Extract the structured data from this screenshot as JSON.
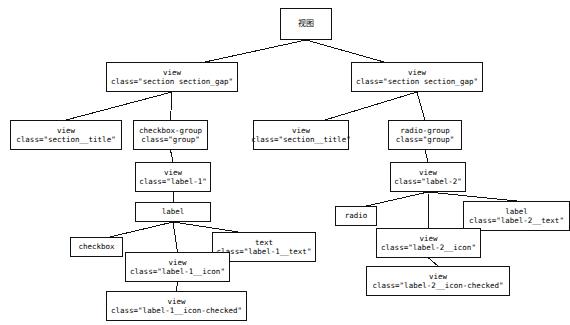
{
  "diagram": {
    "title": "视图",
    "type": "component-tree",
    "nodes": [
      {
        "id": "root",
        "tag": "视图",
        "cls": "",
        "x": 280,
        "y": 8,
        "w": 52,
        "h": 32,
        "cjk": true
      },
      {
        "id": "sec-left",
        "tag": "view",
        "cls": "class=\"section section_gap\"",
        "x": 106,
        "y": 62,
        "w": 132,
        "h": 30,
        "cjk": false
      },
      {
        "id": "sec-right",
        "tag": "view",
        "cls": "class=\"section section_gap\"",
        "x": 351,
        "y": 62,
        "w": 132,
        "h": 30,
        "cjk": false
      },
      {
        "id": "title-left",
        "tag": "view",
        "cls": "class=\"section__title\"",
        "x": 10,
        "y": 120,
        "w": 112,
        "h": 30,
        "cjk": false
      },
      {
        "id": "checkbox-group",
        "tag": "checkbox-group",
        "cls": "class=\"group\"",
        "x": 133,
        "y": 120,
        "w": 75,
        "h": 30,
        "cjk": false
      },
      {
        "id": "title-right",
        "tag": "view",
        "cls": "class=\"section__title\"",
        "x": 253,
        "y": 120,
        "w": 96,
        "h": 30,
        "cjk": false
      },
      {
        "id": "radio-group",
        "tag": "radio-group",
        "cls": "class=\"group\"",
        "x": 388,
        "y": 120,
        "w": 74,
        "h": 30,
        "cjk": false
      },
      {
        "id": "label-1",
        "tag": "view",
        "cls": "class=\"label-1\"",
        "x": 135,
        "y": 162,
        "w": 76,
        "h": 30,
        "cjk": false
      },
      {
        "id": "label-2",
        "tag": "view",
        "cls": "class=\"label-2\"",
        "x": 390,
        "y": 162,
        "w": 76,
        "h": 30,
        "cjk": false
      },
      {
        "id": "label",
        "tag": "label",
        "cls": "",
        "x": 135,
        "y": 202,
        "w": 76,
        "h": 20,
        "cjk": false
      },
      {
        "id": "checkbox",
        "tag": "checkbox",
        "cls": "",
        "x": 70,
        "y": 237,
        "w": 53,
        "h": 20,
        "cjk": false
      },
      {
        "id": "text-1",
        "tag": "text",
        "cls": "class=\"label-1__text\"",
        "x": 212,
        "y": 232,
        "w": 104,
        "h": 30,
        "cjk": false
      },
      {
        "id": "icon-1",
        "tag": "view",
        "cls": "class=\"label-1__icon\"",
        "x": 125,
        "y": 252,
        "w": 105,
        "h": 30,
        "cjk": false
      },
      {
        "id": "icon-1-checked",
        "tag": "view",
        "cls": "class=\"label-1__icon-checked\"",
        "x": 106,
        "y": 291,
        "w": 141,
        "h": 30,
        "cjk": false
      },
      {
        "id": "radio",
        "tag": "radio",
        "cls": "",
        "x": 335,
        "y": 206,
        "w": 42,
        "h": 20,
        "cjk": false
      },
      {
        "id": "text-2",
        "tag": "label",
        "cls": "class=\"label-2__text\"",
        "x": 463,
        "y": 201,
        "w": 107,
        "h": 30,
        "cjk": false
      },
      {
        "id": "icon-2",
        "tag": "view",
        "cls": "class=\"label-2__icon\"",
        "x": 376,
        "y": 228,
        "w": 105,
        "h": 30,
        "cjk": false
      },
      {
        "id": "icon-2-checked",
        "tag": "view",
        "cls": "class=\"label-2__icon-checked\"",
        "x": 366,
        "y": 266,
        "w": 144,
        "h": 30,
        "cjk": false
      }
    ],
    "edges": [
      {
        "from": "root",
        "to": "sec-left"
      },
      {
        "from": "root",
        "to": "sec-right"
      },
      {
        "from": "sec-left",
        "to": "title-left"
      },
      {
        "from": "sec-left",
        "to": "checkbox-group"
      },
      {
        "from": "sec-right",
        "to": "title-right"
      },
      {
        "from": "sec-right",
        "to": "radio-group"
      },
      {
        "from": "checkbox-group",
        "to": "label-1"
      },
      {
        "from": "radio-group",
        "to": "label-2"
      },
      {
        "from": "label-1",
        "to": "label"
      },
      {
        "from": "label",
        "to": "checkbox"
      },
      {
        "from": "label",
        "to": "icon-1"
      },
      {
        "from": "label",
        "to": "text-1"
      },
      {
        "from": "icon-1",
        "to": "icon-1-checked"
      },
      {
        "from": "label-2",
        "to": "radio"
      },
      {
        "from": "label-2",
        "to": "icon-2"
      },
      {
        "from": "label-2",
        "to": "text-2"
      },
      {
        "from": "icon-2",
        "to": "icon-2-checked"
      }
    ],
    "colors": {
      "stroke": "#111111",
      "background": "#ffffff",
      "text": "#000000"
    }
  }
}
